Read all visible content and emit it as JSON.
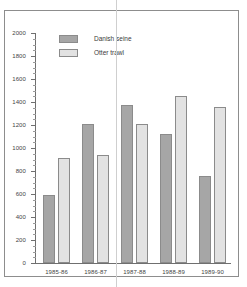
{
  "chart_data": {
    "type": "bar",
    "title": "",
    "subtitle": "",
    "xlabel": "",
    "ylabel": "",
    "ylim": [
      0,
      2000
    ],
    "grid": false,
    "legend_position": "top-left",
    "categories": [
      "1985-86",
      "1986-87",
      "1987-88",
      "1988-89",
      "1989-90"
    ],
    "ytick_labels": [
      "0",
      "200",
      "400",
      "600",
      "800",
      "1000",
      "1200",
      "1400",
      "1600",
      "1800",
      "2000"
    ],
    "ytick_values": [
      0,
      200,
      400,
      600,
      800,
      1000,
      1200,
      1400,
      1600,
      1800,
      2000
    ],
    "minor_tick_interval": 50,
    "series": [
      {
        "name": "Danish seine",
        "color": "#a6a6a6",
        "values": [
          595,
          1205,
          1370,
          1120,
          760
        ]
      },
      {
        "name": "Otter trawl",
        "color": "#e2e2e2",
        "values": [
          915,
          940,
          1205,
          1450,
          1360
        ]
      }
    ]
  },
  "legend": {
    "items": [
      {
        "label": "Danish seine",
        "swatch": "dark"
      },
      {
        "label": "Otter trawl",
        "swatch": "light"
      }
    ]
  },
  "colors": {
    "danish_seine": "#a6a6a6",
    "otter_trawl": "#e2e2e2",
    "axis": "#6f6f6f",
    "frame": "#8d8d8d",
    "text": "#444444"
  }
}
